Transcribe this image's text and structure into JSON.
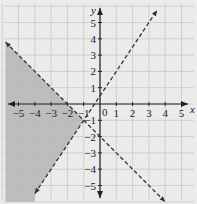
{
  "chart_data": {
    "type": "line",
    "title": "",
    "xlabel": "x",
    "ylabel": "y",
    "xlim": [
      -6,
      6
    ],
    "ylim": [
      -6,
      6
    ],
    "grid": true,
    "x_ticks": [
      "-5",
      "-4",
      "-3",
      "-2",
      "-1",
      "0",
      "1",
      "2",
      "3",
      "4",
      "5"
    ],
    "y_ticks": [
      "5",
      "4",
      "3",
      "2",
      "1",
      "-1",
      "-2",
      "-3",
      "-4",
      "-5"
    ],
    "series": [
      {
        "name": "boundary line 1 (dashed)",
        "equation": "y = 1.5x + 0.5",
        "x": [
          -4,
          3.5
        ],
        "y": [
          -5.5,
          5.75
        ],
        "style": "dashed"
      },
      {
        "name": "boundary line 2 (dashed)",
        "equation": "y = -x - 2",
        "x": [
          -5.8,
          4
        ],
        "y": [
          3.8,
          -6
        ],
        "style": "dashed"
      }
    ],
    "shaded_region": {
      "description": "region left of both lines: y < -x - 2 and y > 1.5x + 0.5",
      "color": "#b5b5b5"
    },
    "origin_label": "0"
  },
  "colors": {
    "background": "#ebebeb",
    "grid": "#c8c8c8",
    "shade": "#b5b5b5",
    "lines": "#333333"
  }
}
